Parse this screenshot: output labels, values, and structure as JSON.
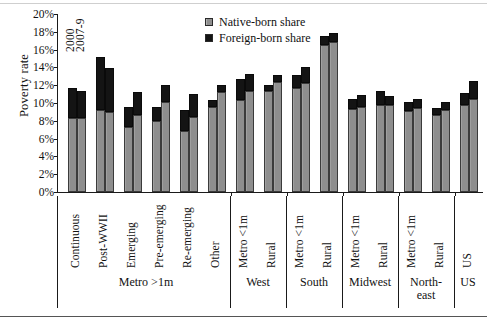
{
  "chart_data": {
    "type": "bar",
    "title": "",
    "subtitle": "",
    "xlabel": "",
    "ylabel": "Poverty rate",
    "ylim": [
      0,
      20
    ],
    "ytick_labels": [
      "0%",
      "2%",
      "4%",
      "6%",
      "8%",
      "10%",
      "12%",
      "14%",
      "16%",
      "18%",
      "20%"
    ],
    "ytick_values": [
      0,
      2,
      4,
      6,
      8,
      10,
      12,
      14,
      16,
      18,
      20
    ],
    "grid": false,
    "stacked": true,
    "legend_position": "top-center",
    "legend": [
      "Native-born share",
      "Foreign-born share"
    ],
    "series_annotations": [
      "2000",
      "2007-9"
    ],
    "categories": [
      "Continuous",
      "Post-WWII",
      "Emerging",
      "Pre-emerging",
      "Re-emerging",
      "Other",
      "Metro <1m",
      "Rural",
      "Metro <1m",
      "Rural",
      "Metro <1m",
      "Rural",
      "Metro <1m",
      "Rural",
      "US"
    ],
    "groups": [
      {
        "label": "Metro >1m",
        "span": 6
      },
      {
        "label": "West",
        "span": 2
      },
      {
        "label": "South",
        "span": 2
      },
      {
        "label": "Midwest",
        "span": 2
      },
      {
        "label": "North-east",
        "span": 2
      },
      {
        "label": "US",
        "span": 1
      }
    ],
    "series": [
      {
        "name": "Native-born share",
        "color": "#8e8e8e",
        "values_2000": [
          8.3,
          9.2,
          7.3,
          8.0,
          6.8,
          9.6,
          10.3,
          11.3,
          11.7,
          16.5,
          9.3,
          9.8,
          9.1,
          8.7,
          9.8
        ],
        "values_2007_9": [
          8.3,
          9.0,
          8.6,
          10.1,
          8.4,
          11.2,
          11.4,
          12.4,
          12.3,
          16.9,
          9.6,
          9.8,
          9.4,
          9.2,
          10.4
        ]
      },
      {
        "name": "Foreign-born share",
        "color": "#141414",
        "values_2000": [
          3.4,
          6.0,
          2.2,
          1.5,
          2.4,
          0.7,
          2.4,
          0.7,
          1.4,
          1.0,
          1.2,
          1.6,
          1.0,
          0.7,
          1.3
        ],
        "values_2007_9": [
          3.1,
          4.9,
          2.6,
          1.9,
          2.6,
          0.8,
          1.9,
          0.8,
          1.7,
          1.0,
          1.3,
          1.0,
          1.1,
          0.9,
          2.1
        ]
      }
    ],
    "totals_2000": [
      11.7,
      15.2,
      9.5,
      9.5,
      9.2,
      10.3,
      12.7,
      12.0,
      13.1,
      17.5,
      10.5,
      11.4,
      10.1,
      9.4,
      11.1
    ],
    "totals_2007_9": [
      11.4,
      13.9,
      11.2,
      12.0,
      11.0,
      12.0,
      13.3,
      13.2,
      14.0,
      17.9,
      10.9,
      10.8,
      10.5,
      10.1,
      12.5
    ]
  }
}
